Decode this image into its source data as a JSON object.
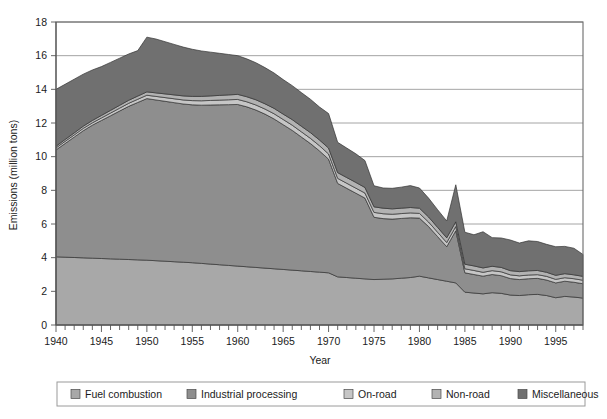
{
  "chart_data": {
    "type": "area",
    "stacked": true,
    "title": "",
    "xlabel": "Year",
    "ylabel": "Emissions (million tons)",
    "xlim": [
      1940,
      1998
    ],
    "ylim": [
      0,
      18
    ],
    "ytick_step": 2,
    "yticks": [
      0,
      2,
      4,
      6,
      8,
      10,
      12,
      14,
      16,
      18
    ],
    "xticks_labeled": [
      1940,
      1945,
      1950,
      1955,
      1960,
      1965,
      1970,
      1975,
      1980,
      1985,
      1990,
      1995
    ],
    "xtick_minor_step": 1,
    "grid": "horizontal",
    "legend_position": "bottom",
    "x": [
      1940,
      1941,
      1942,
      1943,
      1944,
      1945,
      1946,
      1947,
      1948,
      1949,
      1950,
      1951,
      1952,
      1953,
      1954,
      1955,
      1956,
      1957,
      1958,
      1959,
      1960,
      1961,
      1962,
      1963,
      1964,
      1965,
      1966,
      1967,
      1968,
      1969,
      1970,
      1971,
      1972,
      1973,
      1974,
      1975,
      1976,
      1977,
      1978,
      1979,
      1980,
      1981,
      1982,
      1983,
      1984,
      1985,
      1986,
      1987,
      1988,
      1989,
      1990,
      1991,
      1992,
      1993,
      1994,
      1995,
      1996,
      1997,
      1998
    ],
    "series": [
      {
        "name": "Fuel combustion",
        "color": "#a8a8a8",
        "values": [
          4.05,
          4.03,
          4.01,
          3.99,
          3.97,
          3.95,
          3.93,
          3.91,
          3.89,
          3.87,
          3.85,
          3.82,
          3.79,
          3.76,
          3.73,
          3.7,
          3.66,
          3.62,
          3.58,
          3.54,
          3.5,
          3.46,
          3.42,
          3.38,
          3.34,
          3.3,
          3.26,
          3.22,
          3.18,
          3.14,
          3.1,
          2.86,
          2.82,
          2.78,
          2.74,
          2.7,
          2.72,
          2.74,
          2.78,
          2.82,
          2.9,
          2.8,
          2.7,
          2.6,
          2.5,
          1.95,
          1.9,
          1.85,
          1.92,
          1.88,
          1.78,
          1.75,
          1.8,
          1.82,
          1.75,
          1.62,
          1.7,
          1.66,
          1.6
        ]
      },
      {
        "name": "Industrial processing",
        "color": "#8e8e8e",
        "values": [
          6.35,
          6.75,
          7.15,
          7.55,
          7.9,
          8.2,
          8.5,
          8.8,
          9.1,
          9.35,
          9.6,
          9.55,
          9.5,
          9.45,
          9.4,
          9.38,
          9.4,
          9.45,
          9.5,
          9.55,
          9.6,
          9.5,
          9.35,
          9.15,
          8.9,
          8.6,
          8.3,
          7.95,
          7.6,
          7.2,
          6.75,
          5.55,
          5.3,
          5.05,
          4.8,
          3.7,
          3.6,
          3.55,
          3.55,
          3.55,
          3.45,
          3.05,
          2.55,
          2.05,
          3.1,
          1.15,
          1.1,
          1.05,
          1.08,
          1.05,
          0.98,
          0.95,
          0.95,
          0.95,
          0.92,
          0.88,
          0.9,
          0.88,
          0.85
        ]
      },
      {
        "name": "On-road",
        "color": "#c6c6c6",
        "values": [
          0.12,
          0.13,
          0.13,
          0.14,
          0.14,
          0.15,
          0.16,
          0.17,
          0.18,
          0.19,
          0.2,
          0.21,
          0.22,
          0.23,
          0.24,
          0.25,
          0.26,
          0.27,
          0.28,
          0.29,
          0.3,
          0.3,
          0.3,
          0.3,
          0.31,
          0.31,
          0.31,
          0.31,
          0.31,
          0.31,
          0.31,
          0.3,
          0.3,
          0.3,
          0.3,
          0.29,
          0.29,
          0.29,
          0.29,
          0.29,
          0.28,
          0.27,
          0.26,
          0.25,
          0.25,
          0.24,
          0.24,
          0.23,
          0.23,
          0.23,
          0.22,
          0.22,
          0.22,
          0.22,
          0.22,
          0.21,
          0.21,
          0.21,
          0.21
        ]
      },
      {
        "name": "Non-road",
        "color": "#b2b2b2",
        "values": [
          0.1,
          0.11,
          0.12,
          0.13,
          0.14,
          0.15,
          0.16,
          0.17,
          0.18,
          0.19,
          0.2,
          0.21,
          0.22,
          0.23,
          0.24,
          0.25,
          0.26,
          0.27,
          0.28,
          0.29,
          0.3,
          0.3,
          0.31,
          0.31,
          0.32,
          0.32,
          0.33,
          0.33,
          0.34,
          0.34,
          0.35,
          0.34,
          0.34,
          0.34,
          0.33,
          0.33,
          0.33,
          0.32,
          0.32,
          0.32,
          0.31,
          0.3,
          0.29,
          0.28,
          0.28,
          0.27,
          0.27,
          0.26,
          0.26,
          0.26,
          0.25,
          0.25,
          0.25,
          0.25,
          0.24,
          0.24,
          0.24,
          0.23,
          0.23
        ]
      },
      {
        "name": "Miscellaneous",
        "color": "#707070",
        "values": [
          3.38,
          3.28,
          3.19,
          3.09,
          3.0,
          2.9,
          2.85,
          2.8,
          2.75,
          2.7,
          3.25,
          3.2,
          3.1,
          3.0,
          2.9,
          2.8,
          2.7,
          2.6,
          2.5,
          2.4,
          2.3,
          2.25,
          2.2,
          2.15,
          2.1,
          2.05,
          2.02,
          2.0,
          1.98,
          1.96,
          2.05,
          1.8,
          1.75,
          1.7,
          1.6,
          1.25,
          1.2,
          1.22,
          1.25,
          1.3,
          1.2,
          1.12,
          1.05,
          1.0,
          2.2,
          1.9,
          1.85,
          2.15,
          1.7,
          1.75,
          1.82,
          1.7,
          1.78,
          1.72,
          1.66,
          1.7,
          1.62,
          1.58,
          1.3
        ]
      }
    ]
  },
  "legend": {
    "items": [
      {
        "label": "Fuel combustion",
        "color": "#a8a8a8"
      },
      {
        "label": "Industrial processing",
        "color": "#8e8e8e"
      },
      {
        "label": "On-road",
        "color": "#c6c6c6"
      },
      {
        "label": "Non-road",
        "color": "#b2b2b2"
      },
      {
        "label": "Miscellaneous",
        "color": "#707070"
      }
    ]
  }
}
